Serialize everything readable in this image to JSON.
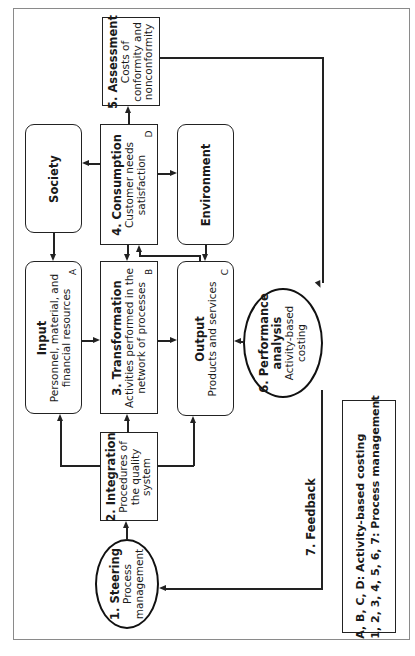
{
  "diagram": {
    "orientation": "rotated-90-ccw",
    "nodes": {
      "assessment": {
        "title": "5. Assessment",
        "lines": [
          "Costs of",
          "conformity and",
          "nonconformity"
        ]
      },
      "society": {
        "title": "Society"
      },
      "consumption": {
        "title": "4. Consumption",
        "lines": [
          "Customer needs",
          "satisfaction"
        ],
        "tag": "D"
      },
      "environment": {
        "title": "Environment"
      },
      "input": {
        "title": "Input",
        "lines": [
          "Personnel, material, and",
          "financial resources"
        ],
        "tag": "A"
      },
      "transformation": {
        "title": "3. Transformation",
        "lines": [
          "Activities performed in the",
          "network of processes"
        ],
        "tag": "B"
      },
      "output": {
        "title": "Output",
        "lines": [
          "Products and services"
        ],
        "tag": "C"
      },
      "integration": {
        "title": "2. Integration",
        "lines": [
          "Procedures of",
          "the quality",
          "system"
        ]
      },
      "steering": {
        "title": "1. Steering",
        "lines": [
          "Process",
          "management"
        ]
      },
      "performance": {
        "title_lines": [
          "6. Performance",
          "analysis"
        ],
        "lines": [
          "Activity-based",
          "costing"
        ]
      }
    },
    "feedback_label": "7. Feedback",
    "legend": {
      "lines": [
        "A, B, C, D: Activity-based costing",
        "1, 2, 3, 4, 5, 6, 7: Process management"
      ]
    },
    "edges": [
      {
        "from": "steering",
        "to": "integration"
      },
      {
        "from": "integration",
        "to": "input"
      },
      {
        "from": "integration",
        "to": "transformation"
      },
      {
        "from": "integration",
        "to": "output"
      },
      {
        "from": "input",
        "to": "transformation"
      },
      {
        "from": "transformation",
        "to": "output"
      },
      {
        "from": "output",
        "to": "consumption"
      },
      {
        "from": "consumption",
        "to": "transformation"
      },
      {
        "from": "consumption",
        "to": "assessment"
      },
      {
        "from": "consumption",
        "to": "society"
      },
      {
        "from": "consumption",
        "to": "environment"
      },
      {
        "from": "society",
        "to": "input"
      },
      {
        "from": "environment",
        "to": "output"
      },
      {
        "from": "assessment",
        "to": "performance"
      },
      {
        "from": "performance",
        "to": "output"
      },
      {
        "from": "performance",
        "to": "steering",
        "label": "7. Feedback"
      }
    ]
  }
}
